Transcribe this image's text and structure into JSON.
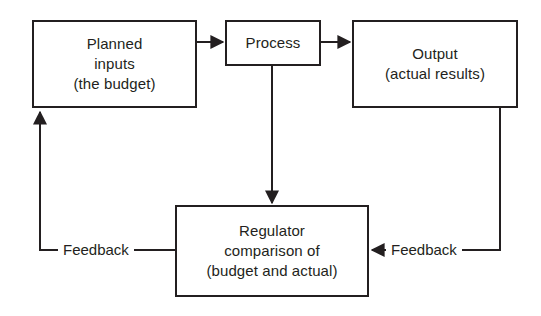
{
  "diagram": {
    "stroke_color": "#231f20",
    "background_color": "#ffffff",
    "nodes": [
      {
        "id": "planned-inputs",
        "lines": [
          "Planned",
          "inputs",
          "(the budget)"
        ]
      },
      {
        "id": "process",
        "lines": [
          "Process"
        ]
      },
      {
        "id": "output",
        "lines": [
          "Output",
          "(actual results)"
        ]
      },
      {
        "id": "regulator",
        "lines": [
          "Regulator",
          "comparison of",
          "(budget and actual)"
        ]
      }
    ],
    "edge_labels": {
      "feedback_left": "Feedback",
      "feedback_right": "Feedback"
    },
    "edges": [
      {
        "from": "planned-inputs",
        "to": "process",
        "label": "",
        "direction": "right"
      },
      {
        "from": "process",
        "to": "output",
        "label": "",
        "direction": "right"
      },
      {
        "from": "process",
        "to": "regulator",
        "label": "",
        "direction": "down"
      },
      {
        "from": "output",
        "to": "regulator",
        "label": "Feedback",
        "direction": "left"
      },
      {
        "from": "regulator",
        "to": "planned-inputs",
        "label": "Feedback",
        "direction": "up"
      }
    ]
  }
}
